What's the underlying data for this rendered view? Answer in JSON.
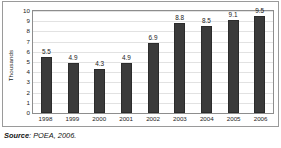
{
  "chart_data": {
    "type": "bar",
    "title": "",
    "xlabel": "",
    "ylabel": "Thousands",
    "categories": [
      "1998",
      "1999",
      "2000",
      "2001",
      "2002",
      "2003",
      "2004",
      "2005",
      "2006"
    ],
    "values": [
      5.5,
      4.9,
      4.3,
      4.9,
      6.9,
      8.8,
      8.5,
      9.1,
      9.5
    ],
    "value_labels": [
      "5.5",
      "4.9",
      "4.3",
      "4.9",
      "6.9",
      "8.8",
      "8.5",
      "9.1",
      "9.5"
    ],
    "ylim": [
      0,
      10
    ],
    "ytick_labels": [
      "0",
      "1",
      "2",
      "3",
      "4",
      "5",
      "6",
      "7",
      "8",
      "9",
      "10"
    ],
    "ytick_values": [
      0,
      1,
      2,
      3,
      4,
      5,
      6,
      7,
      8,
      9,
      10
    ],
    "grid": true,
    "legend": "none",
    "bar_color": "#3a3a3a",
    "grid_color": "#e2e2e2",
    "axis_color": "#8d8d8d",
    "text_color": "#1a1a1a"
  },
  "caption": {
    "source_word": "Source",
    "source_separator": ": ",
    "source_text": "POEA, 2006."
  }
}
